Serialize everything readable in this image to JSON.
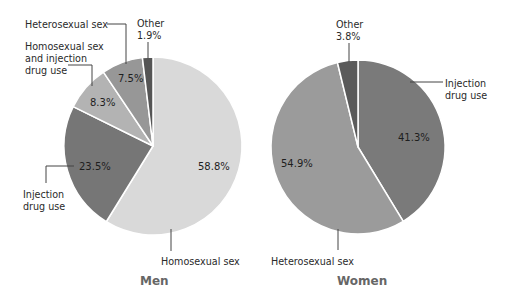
{
  "chart_data": [
    {
      "type": "pie",
      "title": "Men",
      "start_angle": "12 o'clock, clockwise",
      "slices": [
        {
          "label": "Homosexual sex",
          "value": 58.8,
          "label_text": "58.8%",
          "color": "#d9d9d9"
        },
        {
          "label": "Injection drug use",
          "value": 23.5,
          "label_text": "23.5%",
          "color": "#767676"
        },
        {
          "label": "Homosexual sex and injection drug use",
          "value": 8.3,
          "label_text": "8.3%",
          "color": "#b3b3b3"
        },
        {
          "label": "Heterosexual sex",
          "value": 7.5,
          "label_text": "7.5%",
          "color": "#979797"
        },
        {
          "label": "Other",
          "value": 1.9,
          "label_text": "1.9%",
          "color": "#555555"
        }
      ]
    },
    {
      "type": "pie",
      "title": "Women",
      "start_angle": "12 o'clock, clockwise",
      "slices": [
        {
          "label": "Injection drug use",
          "value": 41.3,
          "label_text": "41.3%",
          "color": "#7a7a7a"
        },
        {
          "label": "Heterosexual sex",
          "value": 54.9,
          "label_text": "54.9%",
          "color": "#9b9b9b"
        },
        {
          "label": "Other",
          "value": 3.8,
          "label_text": "3.8%",
          "color": "#5a5a5a"
        }
      ]
    }
  ],
  "men": {
    "title": "Men",
    "labels": {
      "heterosexual": "Heterosexual sex",
      "other": "Other",
      "other_pct": "1.9%",
      "homo_inj_line1": "Homosexual sex",
      "homo_inj_line2": "and injection",
      "homo_inj_line3": "drug use",
      "injection_line1": "Injection",
      "injection_line2": "drug use",
      "homosexual": "Homosexual sex"
    },
    "pcts": {
      "homosexual": "58.8%",
      "injection": "23.5%",
      "homo_inj": "8.3%",
      "heterosexual": "7.5%"
    }
  },
  "women": {
    "title": "Women",
    "labels": {
      "other": "Other",
      "other_pct": "3.8%",
      "injection_line1": "Injection",
      "injection_line2": "drug use",
      "heterosexual": "Heterosexual sex"
    },
    "pcts": {
      "injection": "41.3%",
      "heterosexual": "54.9%"
    }
  }
}
